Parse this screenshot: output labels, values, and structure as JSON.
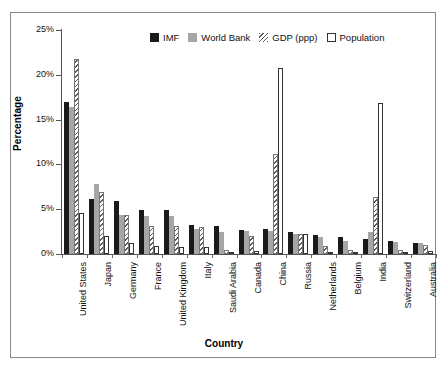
{
  "chart_data": {
    "type": "bar",
    "title": "",
    "xlabel": "Country",
    "ylabel": "Percentage",
    "ylim": [
      0,
      25
    ],
    "ytick_labels": [
      "0%",
      "5%",
      "10%",
      "15%",
      "20%",
      "25%"
    ],
    "ytick_values": [
      0,
      5,
      10,
      15,
      20,
      25
    ],
    "grid": false,
    "legend_position": "top-center",
    "categories": [
      "United States",
      "Japan",
      "Germany",
      "France",
      "United Kingdom",
      "Italy",
      "Saudi Arabia",
      "Canada",
      "China",
      "Russia",
      "Netherlands",
      "Belgium",
      "India",
      "Switzerland",
      "Australia"
    ],
    "series": [
      {
        "name": "IMF",
        "style": "solid-black",
        "color": "#1a1a1a",
        "values": [
          17.0,
          6.1,
          5.9,
          4.9,
          4.9,
          3.2,
          3.1,
          2.7,
          2.8,
          2.5,
          2.1,
          1.9,
          1.7,
          1.4,
          1.2
        ]
      },
      {
        "name": "World Bank",
        "style": "solid-gray",
        "color": "#a6a6a6",
        "values": [
          16.4,
          7.8,
          4.4,
          4.2,
          4.2,
          2.8,
          2.5,
          2.6,
          2.6,
          2.2,
          1.9,
          1.5,
          2.5,
          1.3,
          1.2
        ]
      },
      {
        "name": "GDP (ppp)",
        "style": "hatched",
        "color": "#5a5a5a",
        "values": [
          21.8,
          6.9,
          4.3,
          3.1,
          3.1,
          3.0,
          0.5,
          2.0,
          11.2,
          2.2,
          0.9,
          0.5,
          6.4,
          0.4,
          1.0
        ]
      },
      {
        "name": "Population",
        "style": "outline-white",
        "color": "#ffffff",
        "values": [
          4.6,
          2.0,
          1.2,
          0.9,
          0.8,
          0.8,
          0.1,
          0.3,
          20.8,
          2.2,
          0.2,
          0.1,
          16.8,
          0.1,
          0.3
        ]
      }
    ]
  },
  "legend": {
    "items": [
      {
        "label": "IMF",
        "swatch": "legend-swatch-imf"
      },
      {
        "label": "World Bank",
        "swatch": "legend-swatch-world-bank"
      },
      {
        "label": "GDP (ppp)",
        "swatch": "legend-swatch-gdp-ppp"
      },
      {
        "label": "Population",
        "swatch": "legend-swatch-population"
      }
    ]
  },
  "axes": {
    "y_title": "Percentage",
    "x_title": "Country"
  }
}
